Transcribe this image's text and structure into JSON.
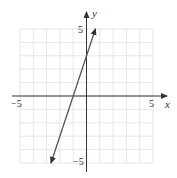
{
  "chart_data": {
    "type": "line",
    "title": "",
    "xlabel": "x",
    "ylabel": "y",
    "xlim": [
      -5,
      5
    ],
    "ylim": [
      -5,
      5
    ],
    "grid": true,
    "x_tick_labels": [
      "-5",
      "5"
    ],
    "y_tick_labels": [
      "5",
      "-5"
    ],
    "series": [
      {
        "name": "y = 3x + 3",
        "equation": "y = 3x + 3",
        "x": [
          -2.67,
          -1,
          0,
          0.67
        ],
        "y": [
          -5,
          0,
          3,
          5
        ],
        "arrows_both_ends": true
      }
    ]
  },
  "labels": {
    "x_axis": "x",
    "y_axis": "y",
    "x_min": "−5",
    "x_max": "5",
    "y_max": "5",
    "y_min": "−5"
  },
  "colors": {
    "grid": "#e6e6e6",
    "axis": "#333333",
    "line": "#555555"
  }
}
